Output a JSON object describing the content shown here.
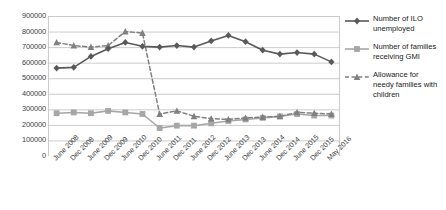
{
  "chart_data": {
    "type": "line",
    "title": "",
    "xlabel": "",
    "ylabel": "",
    "ylim": [
      0,
      900000
    ],
    "ytick_step": 100000,
    "yticks": [
      "900000",
      "800000",
      "700000",
      "600000",
      "500000",
      "400000",
      "300000",
      "200000",
      "100000",
      "0"
    ],
    "grid": true,
    "legend_position": "right",
    "categories": [
      "June 2008",
      "Dec 2008",
      "June 2009",
      "Dec 2009",
      "June 2010",
      "Dec 2010",
      "June 2011",
      "Dec 2011",
      "June 2012",
      "Dec 2012",
      "June 2013",
      "Dec 2013",
      "June 2014",
      "Dec 2014",
      "June 2015",
      "Dec 2015",
      "May 2016"
    ],
    "series": [
      {
        "name": "Number of ILO unemployed",
        "color": "#595959",
        "marker": "diamond",
        "dash": "solid",
        "values": [
          565000,
          570000,
          640000,
          690000,
          730000,
          705000,
          700000,
          710000,
          700000,
          740000,
          775000,
          735000,
          680000,
          655000,
          665000,
          655000,
          605000
        ]
      },
      {
        "name": "Number of families receiving GMI",
        "color": "#a6a6a6",
        "marker": "square",
        "dash": "solid",
        "values": [
          275000,
          280000,
          275000,
          290000,
          280000,
          270000,
          180000,
          195000,
          195000,
          210000,
          225000,
          235000,
          245000,
          255000,
          270000,
          260000,
          260000
        ]
      },
      {
        "name": "Allowance for needy families with children",
        "color": "#808080",
        "marker": "triangle",
        "dash": "dashed",
        "values": [
          730000,
          710000,
          700000,
          710000,
          800000,
          790000,
          270000,
          290000,
          255000,
          240000,
          235000,
          245000,
          250000,
          255000,
          280000,
          275000,
          270000
        ]
      }
    ]
  },
  "legend": {
    "items": [
      {
        "label": "Number of ILO unemployed"
      },
      {
        "label": "Number of families receiving GMI"
      },
      {
        "label": "Allowance for needy families with children"
      }
    ]
  }
}
